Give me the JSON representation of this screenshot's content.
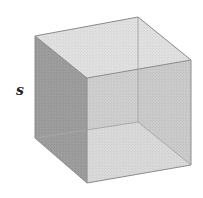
{
  "figure": {
    "type": "cube",
    "label": "s",
    "colors": {
      "left_face": "#9a9a9a",
      "top_face": "#dcdcdc",
      "front_face": "#cfcfcf",
      "back_face": "#c4c4c4",
      "bottom_face": "#e2e2e2",
      "right_face": "#bdbdbd",
      "edge": "#8a8a8a",
      "hidden_edge": "#a8a8a8"
    }
  }
}
